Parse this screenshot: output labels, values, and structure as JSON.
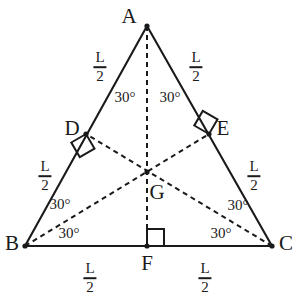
{
  "figure": {
    "type": "geometry-diagram",
    "canvas": {
      "width": 299,
      "height": 303,
      "background": "#ffffff"
    },
    "stroke_color": "#1a1a1a",
    "text_color": "#1a1a1a"
  },
  "points": [
    {
      "id": "A",
      "label": "A",
      "x": 147,
      "y": 26,
      "label_x": 129,
      "label_y": 16,
      "dot": true
    },
    {
      "id": "B",
      "label": "B",
      "x": 25,
      "y": 246,
      "label_x": 12,
      "label_y": 243,
      "dot": true
    },
    {
      "id": "C",
      "label": "C",
      "x": 272,
      "y": 246,
      "label_x": 286,
      "label_y": 243,
      "dot": true
    },
    {
      "id": "D",
      "label": "D",
      "x": 86,
      "y": 134,
      "label_x": 72,
      "label_y": 128,
      "dot": true
    },
    {
      "id": "E",
      "label": "E",
      "x": 209,
      "y": 134,
      "label_x": 223,
      "label_y": 128,
      "dot": true
    },
    {
      "id": "F",
      "label": "F",
      "x": 147,
      "y": 246,
      "label_x": 147,
      "label_y": 263,
      "dot": true
    },
    {
      "id": "G",
      "label": "G",
      "x": 147,
      "y": 172,
      "label_x": 157,
      "label_y": 192,
      "dot": true
    }
  ],
  "solid_edges": [
    {
      "name": "side-AB",
      "from": "A",
      "to": "B"
    },
    {
      "name": "side-AC",
      "from": "A",
      "to": "C"
    },
    {
      "name": "side-BC",
      "from": "B",
      "to": "C"
    }
  ],
  "dashed_edges": [
    {
      "name": "median-A-F",
      "from": "A",
      "to": "F"
    },
    {
      "name": "median-B-E",
      "from": "B",
      "to": "E"
    },
    {
      "name": "median-C-D",
      "from": "C",
      "to": "D"
    }
  ],
  "right_angle_marks": [
    {
      "name": "right-angle-at-D",
      "x": 86,
      "y": 134,
      "size": 17,
      "rotation": 60
    },
    {
      "name": "right-angle-at-E",
      "x": 209,
      "y": 134,
      "size": 17,
      "rotation": 210
    },
    {
      "name": "right-angle-at-F",
      "x": 147,
      "y": 246,
      "size": 17,
      "rotation": 270
    }
  ],
  "angle_labels": [
    {
      "name": "angle-BAF",
      "text": "30°",
      "x": 125,
      "y": 97
    },
    {
      "name": "angle-FAC",
      "text": "30°",
      "x": 170,
      "y": 97
    },
    {
      "name": "angle-DBG",
      "text": "30°",
      "x": 60,
      "y": 204
    },
    {
      "name": "angle-GBF",
      "text": "30°",
      "x": 69,
      "y": 233
    },
    {
      "name": "angle-GCE",
      "text": "30°",
      "x": 238,
      "y": 205
    },
    {
      "name": "angle-FCG",
      "text": "30°",
      "x": 221,
      "y": 233
    }
  ],
  "length_labels": [
    {
      "name": "length-AD",
      "numerator": "L",
      "denominator": "2",
      "x": 100,
      "y": 67
    },
    {
      "name": "length-AE",
      "numerator": "L",
      "denominator": "2",
      "x": 196,
      "y": 67
    },
    {
      "name": "length-DB",
      "numerator": "L",
      "denominator": "2",
      "x": 45,
      "y": 176
    },
    {
      "name": "length-EC",
      "numerator": "L",
      "denominator": "2",
      "x": 254,
      "y": 176
    },
    {
      "name": "length-BF",
      "numerator": "L",
      "denominator": "2",
      "x": 90,
      "y": 278
    },
    {
      "name": "length-FC",
      "numerator": "L",
      "denominator": "2",
      "x": 205,
      "y": 278
    }
  ]
}
